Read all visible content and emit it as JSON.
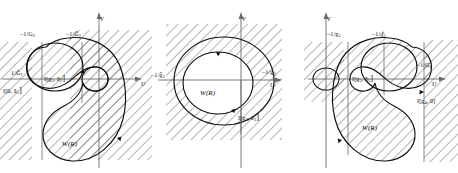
{
  "figure": {
    "type": "math-diagram",
    "panel_count": 3,
    "line_color": "#111111",
    "hatch_color": "#333333",
    "axis_color": "#555555"
  },
  "panels": [
    {
      "id": "panel-1",
      "axis_u": "U",
      "axis_v": "V",
      "tick_top_left": "–1/G",
      "tick_top_left_sub": "2",
      "tick_top_right": "–1/Ḡ",
      "tick_top_right_sub": "2",
      "tick_left": "1/Ḡ",
      "tick_left_sub": "1",
      "interval_left": "I[0, ā",
      "interval_left_sub": "1",
      "interval_center": "I[g",
      "interval_center_sub_a": "2",
      "interval_center_b": ", ā",
      "interval_center_sub_b": "2",
      "region_label": "W(R)"
    },
    {
      "id": "panel-2",
      "axis_u": "U",
      "axis_v": "V",
      "tick_left": "–1/ḡ",
      "tick_left_sub": "3",
      "tick_right": "–1/g",
      "tick_right_sub": "3",
      "interval_bottom": "I[g",
      "interval_bottom_sub_a": "3",
      "interval_bottom_b": ", ā",
      "interval_bottom_sub_b": "3",
      "region_label": "W(R)"
    },
    {
      "id": "panel-3",
      "axis_u": "U",
      "axis_v": "V",
      "tick_top_left": "–1/g",
      "tick_top_left_sub": "5",
      "tick_top_right": "–1/ɠ̄",
      "tick_top_right_sub": "5",
      "tick_right": "–1/G",
      "tick_right_sub": "4",
      "interval_center": "I[g",
      "interval_center_sub_a": "5",
      "interval_center_b": ", ā",
      "interval_center_sub_b": "5",
      "interval_right": "I[g",
      "interval_right_sub": "4",
      "interval_right_b": ", 0]",
      "region_label": "W(R)"
    }
  ]
}
